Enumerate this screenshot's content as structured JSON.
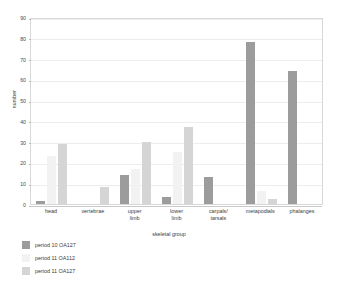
{
  "chart_data": {
    "type": "bar",
    "title": "",
    "xlabel": "skeletal group",
    "ylabel": "number",
    "ylim": [
      0,
      90
    ],
    "ytick_step": 10,
    "yticks": [
      "0",
      "10",
      "20",
      "30",
      "40",
      "50",
      "60",
      "70",
      "80",
      "90"
    ],
    "grid": true,
    "legend_position": "bottom-left",
    "categories": [
      "head",
      "vertebrae",
      "upper limb",
      "lower limb",
      "carpals/ tarsals",
      "metapodials",
      "phalanges"
    ],
    "category_lines": [
      [
        "head"
      ],
      [
        "vertebrae"
      ],
      [
        "upper",
        "limb"
      ],
      [
        "lower",
        "limb"
      ],
      [
        "carpals/",
        "tarsals"
      ],
      [
        "metapodials"
      ],
      [
        "phalanges"
      ]
    ],
    "series": [
      {
        "name": "period 10 OA127",
        "color": "#9c9c9c",
        "values": [
          1.5,
          0,
          14,
          3.5,
          13,
          78,
          64
        ]
      },
      {
        "name": "period 11 OA112",
        "color": "#f2f2f2",
        "values": [
          23,
          0,
          17,
          25,
          0,
          6.5,
          0
        ]
      },
      {
        "name": "period 11 OA127",
        "color": "#d5d5d5",
        "values": [
          29,
          8,
          30,
          37,
          0,
          2.5,
          0
        ]
      }
    ]
  },
  "legend": {
    "items": [
      {
        "label": "period 10 OA127",
        "color": "#9c9c9c"
      },
      {
        "label": "period 11 OA112",
        "color": "#f2f2f2"
      },
      {
        "label": "period 11 OA127",
        "color": "#d5d5d5"
      }
    ]
  }
}
